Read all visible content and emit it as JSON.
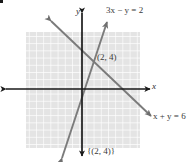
{
  "figure": {
    "type": "coordinate-graph",
    "width": 196,
    "height": 162,
    "background_color": "#ffffff",
    "bullet_marker": "▪",
    "grid": {
      "fill_color": "#e3e3e3",
      "line_color": "#ffffff",
      "left": 26,
      "top": 32,
      "width": 114,
      "height": 116,
      "cell_size": 7.2
    },
    "axes": {
      "color": "#1a1a1a",
      "origin_x": 82,
      "origin_y": 89,
      "x_axis_label": "x",
      "y_axis_label": "y",
      "x_axis_start": 6,
      "x_axis_end": 150,
      "y_axis_start": 13,
      "y_axis_end": 156
    },
    "lines": [
      {
        "id": "line-3x-minus-y-equals-2",
        "equation_text": "3x − y = 2",
        "equation_parts": {
          "coefficient": "3",
          "x": "x",
          "operator": " − ",
          "y": "y",
          "equals": " = ",
          "constant": "2"
        },
        "color": "#7b7b7b",
        "slope": 3,
        "intercept": -2,
        "x1": 62,
        "y1": 158,
        "x2": 107,
        "y2": 22
      },
      {
        "id": "line-x-plus-y-equals-6",
        "equation_text": "x + y = 6",
        "equation_parts": {
          "x": "x",
          "operator": " + ",
          "y": "y",
          "equals": " = ",
          "constant": "6"
        },
        "color": "#7b7b7b",
        "slope": -1,
        "intercept": 6,
        "x1": 51,
        "y1": 21,
        "x2": 151,
        "y2": 116
      }
    ],
    "intersection": {
      "label": "(2, 4)",
      "x_value": 2,
      "y_value": 4,
      "plot_x": 91,
      "plot_y": 60
    },
    "solution_set": {
      "label": "{(2, 4)}"
    }
  }
}
